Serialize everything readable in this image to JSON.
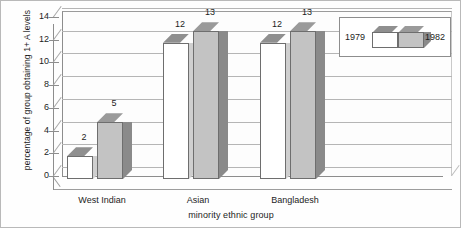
{
  "chart_data": {
    "type": "bar",
    "title": "",
    "xlabel": "minority ethnic group",
    "ylabel": "percentage of group obtaining 1+ A levels",
    "categories": [
      "West Indian",
      "Asian",
      "Bangladesh"
    ],
    "series": [
      {
        "name": "1979",
        "values": [
          2,
          12,
          12
        ],
        "color": "#ffffff"
      },
      {
        "name": "1982",
        "values": [
          5,
          13,
          13
        ],
        "color": "#c3c3c3"
      }
    ],
    "ylim": [
      0,
      14
    ],
    "yticks": [
      0,
      2,
      4,
      6,
      8,
      10,
      12,
      14
    ],
    "ytick_labels": [
      "0",
      "2",
      "4",
      "6",
      "8",
      "10",
      "12",
      "14"
    ],
    "grid": true,
    "legend_position": "top-right",
    "style": "3d-column",
    "data_labels": [
      {
        "category": "West Indian",
        "series": "1979",
        "text": "2"
      },
      {
        "category": "West Indian",
        "series": "1982",
        "text": "5"
      },
      {
        "category": "Asian",
        "series": "1979",
        "text": "12"
      },
      {
        "category": "Asian",
        "series": "1982",
        "text": "13"
      },
      {
        "category": "Bangladesh",
        "series": "1979",
        "text": "12"
      },
      {
        "category": "Bangladesh",
        "series": "1982",
        "text": "13"
      }
    ]
  },
  "legend": {
    "left_label": "1979",
    "right_label": "1982"
  },
  "colors": {
    "bar_1979_fill": "#ffffff",
    "bar_1982_fill": "#c3c3c3",
    "bar_top_shade": "#8f8f8f",
    "bar_side_shade": "#8a8a8a",
    "gridline": "#b5b5b5",
    "axis": "#8d8d8d",
    "text": "#1d1d1d",
    "background": "#fefefe"
  }
}
